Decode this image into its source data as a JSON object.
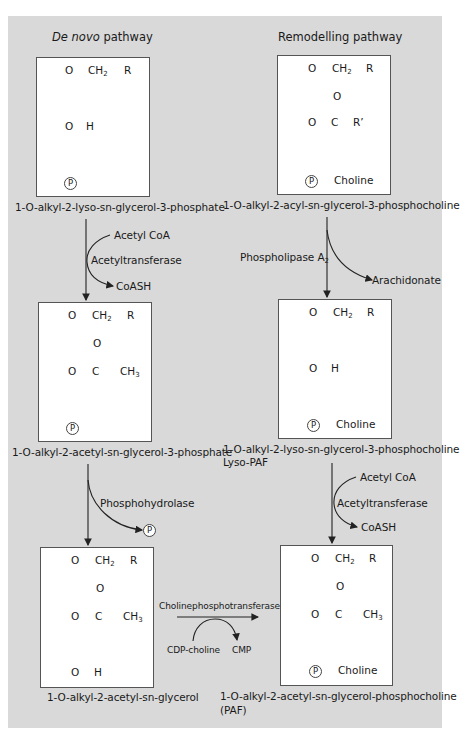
{
  "headers": {
    "left_title_italic": "De novo",
    "left_title_rest": " pathway",
    "right_title": "Remodelling pathway"
  },
  "atoms": {
    "O": "O",
    "CH2": "CH",
    "CH2_sub": "2",
    "CH3": "CH",
    "CH3_sub": "3",
    "R": "R",
    "R_prime": "R’",
    "H": "H",
    "C": "C",
    "P": "P",
    "choline": "Choline"
  },
  "compounds": {
    "c1": "1-O-alkyl-2-lyso-sn-glycerol-3-phosphate",
    "c2": "1-O-alkyl-2-acyl-sn-glycerol-3-phosphocholine",
    "c3": "1-O-alkyl-2-acetyl-sn-glycerol-3-phosphate",
    "c4_line1": "1-O-alkyl-2-lyso-sn-glycerol-3-phosphocholine",
    "c4_line2": "Lyso-PAF",
    "c5": "1-O-alkyl-2-acetyl-sn-glycerol",
    "c6_line1": "1-O-alkyl-2-acetyl-sn-glycerol-phosphocholine",
    "c6_line2": "(PAF)"
  },
  "reactions": {
    "left_step1": {
      "input": "Acetyl CoA",
      "enzyme": "Acetyltransferase",
      "output": "CoASH"
    },
    "right_step1": {
      "enzyme": "Phospholipase A",
      "enzyme_sub": "2",
      "output": "Arachidonate"
    },
    "left_step2": {
      "enzyme": "Phosphohydrolase",
      "output": "P"
    },
    "right_step2": {
      "input": "Acetyl CoA",
      "enzyme": "Acetyltransferase",
      "output": "CoASH"
    },
    "cross_step": {
      "enzyme": "Cholinephosphotransferase",
      "input": "CDP-choline",
      "output": "CMP"
    }
  },
  "colors": {
    "panel_bg": "#d9d9d9",
    "box_bg": "#ffffff",
    "line": "#333333"
  }
}
